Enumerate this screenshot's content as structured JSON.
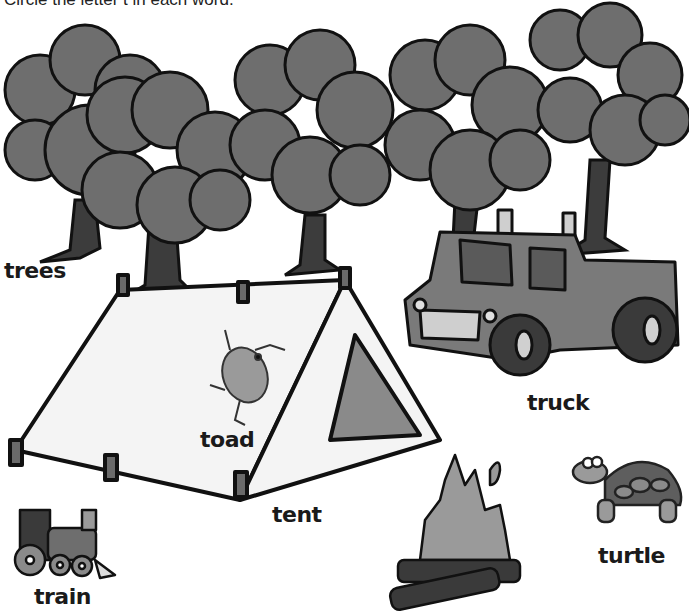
{
  "instruction": "Circle the letter t in each word.",
  "words": {
    "trees": "trees",
    "toad": "toad",
    "tent": "tent",
    "truck": "truck",
    "train": "train",
    "turtle": "turtle"
  },
  "pictures": [
    "trees",
    "tent",
    "toad",
    "truck",
    "campfire",
    "train",
    "turtle"
  ],
  "colors": {
    "foliage": "#6e6e6e",
    "trunk": "#3c3c3c",
    "outline": "#111111",
    "tent": "#f4f4f4",
    "tent_shadow": "#8a8a8a",
    "truck": "#7a7a7a",
    "flame": "#9a9a9a",
    "log": "#3a3a3a"
  }
}
